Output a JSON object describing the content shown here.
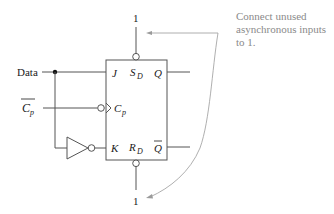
{
  "diagram": {
    "type": "jk-flip-flop-as-d-flip-flop",
    "inputs": {
      "data_label": "Data",
      "clock_label": "C",
      "clock_sub": "p",
      "clock_inverted_label": true
    },
    "block": {
      "pins": {
        "j": "J",
        "k": "K",
        "cp": "C",
        "cp_sub": "p",
        "sd": "S",
        "sd_sub": "D",
        "rd": "R",
        "rd_sub": "D",
        "q": "Q",
        "qbar": "Q"
      }
    },
    "constants": {
      "top": "1",
      "bottom": "1"
    },
    "annotation": {
      "line1": "Connect unused",
      "line2": "asynchronous inputs",
      "line3": "to 1."
    },
    "colors": {
      "wire": "#555555",
      "text": "#1a1a1a",
      "annotation": "#8a8a8a",
      "leader": "#9a9a9a"
    }
  }
}
